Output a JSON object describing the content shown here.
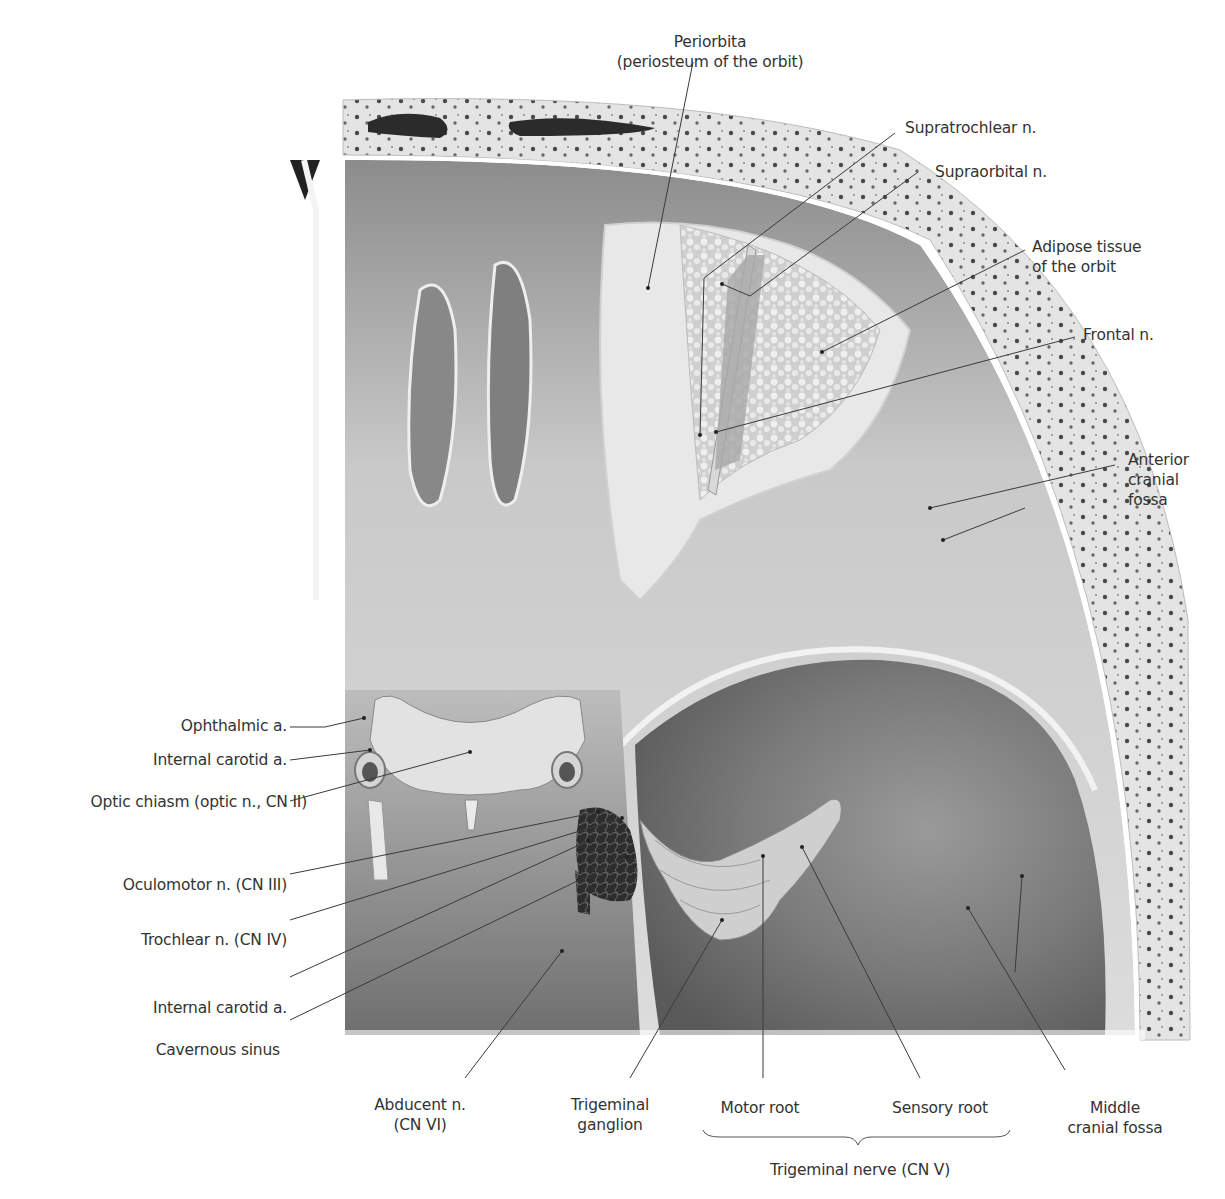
{
  "figure": {
    "labels": {
      "periorbita": [
        "Periorbita",
        "(periosteum of the orbit)"
      ],
      "supratrochlear": [
        "Supratrochlear n."
      ],
      "supraorbital": [
        "Supraorbital n."
      ],
      "adipose": [
        "Adipose tissue",
        "of the orbit"
      ],
      "frontal": [
        "Frontal n."
      ],
      "anterior_fossa": [
        "Anterior",
        "cranial",
        "fossa"
      ],
      "ophthalmic": [
        "Ophthalmic a."
      ],
      "ica_1": [
        "Internal carotid a."
      ],
      "optic_chiasm": [
        "Optic chiasm (optic n., CN II)"
      ],
      "oculomotor": [
        "Oculomotor n. (CN III)"
      ],
      "trochlear": [
        "Trochlear n. (CN IV)"
      ],
      "ica_2": [
        "Internal carotid a."
      ],
      "cavernous": [
        "Cavernous sinus"
      ],
      "abducent": [
        "Abducent n.",
        "(CN VI)"
      ],
      "trig_ganglion": [
        "Trigeminal",
        "ganglion"
      ],
      "motor_root": [
        "Motor root"
      ],
      "sensory_root": [
        "Sensory root"
      ],
      "middle_fossa": [
        "Middle",
        "cranial fossa"
      ],
      "trig_nerve": [
        "Trigeminal nerve (CN V)"
      ]
    },
    "colors": {
      "text": "#333333",
      "leader": "#3a3a3a",
      "bone": "#e6e6e6",
      "fossa_dark": "#6e6e6e",
      "background": "#ffffff"
    }
  }
}
